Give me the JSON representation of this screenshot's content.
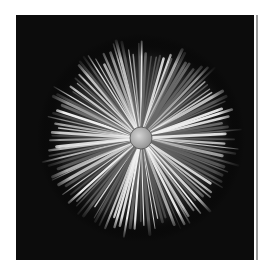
{
  "image": {
    "subject": "radial starburst flower macro",
    "colors": {
      "background": "#0c0c0c",
      "ray_light": "#f2f2f2",
      "ray_dark": "#6a6a6a",
      "disc": "#b5b5b5",
      "page": "#ffffff",
      "edge_line": "#9a9a9a"
    },
    "burst": {
      "center_x": 125,
      "center_y": 123,
      "radius": 100,
      "disc_radius": 11,
      "ray_count": 120
    }
  }
}
